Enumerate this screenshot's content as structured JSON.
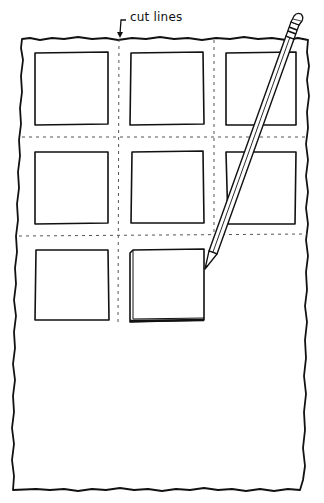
{
  "illustration": {
    "annotation": "cut lines",
    "colors": {
      "ink": "#111111",
      "paper": "#ffffff",
      "dash": "#555555"
    },
    "paper_sheet": {
      "x": 22,
      "y": 38,
      "w": 286,
      "h": 452
    },
    "grid": {
      "columns": 3,
      "rows": 3,
      "cut_lines_vertical_x": [
        118,
        214
      ],
      "cut_lines_horizontal_y": [
        137,
        235
      ]
    },
    "squares": [
      {
        "row": 1,
        "col": 1,
        "state": "outlined"
      },
      {
        "row": 1,
        "col": 2,
        "state": "outlined"
      },
      {
        "row": 1,
        "col": 3,
        "state": "outlined"
      },
      {
        "row": 2,
        "col": 1,
        "state": "outlined"
      },
      {
        "row": 2,
        "col": 2,
        "state": "outlined"
      },
      {
        "row": 2,
        "col": 3,
        "state": "outlined"
      },
      {
        "row": 3,
        "col": 1,
        "state": "outlined"
      },
      {
        "row": 3,
        "col": 2,
        "state": "being-traced"
      }
    ],
    "tool": "pencil-icon"
  }
}
